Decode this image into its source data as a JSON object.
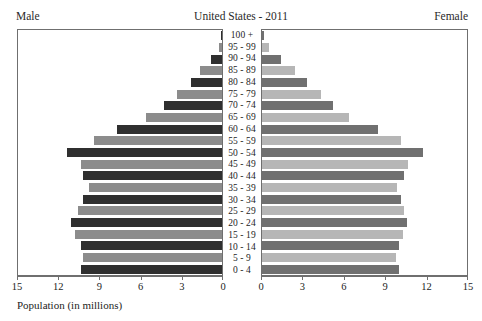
{
  "header": {
    "left_label": "Male",
    "title": "United States - 2011",
    "right_label": "Female"
  },
  "axis": {
    "xlabel": "Population (in millions)",
    "male_ticks": [
      "15",
      "12",
      "9",
      "6",
      "3",
      "0"
    ],
    "female_ticks": [
      "0",
      "3",
      "6",
      "9",
      "12",
      "15"
    ]
  },
  "colors": {
    "male_dark": "#2f2f2f",
    "male_light": "#8c8c8c",
    "female_dark": "#707070",
    "female_light": "#b6b6b6",
    "frame": "#6f6f6f",
    "background": "#ffffff"
  },
  "chart_data": {
    "type": "bar",
    "title": "United States - 2011",
    "subtitle": "",
    "xlabel": "Population (in millions)",
    "ylabel": "",
    "xlim": [
      0,
      15
    ],
    "grid": false,
    "legend_position": "top-outside",
    "orientation": "horizontal-population-pyramid",
    "categories": [
      "100 +",
      "95 - 99",
      "90 - 94",
      "85 - 89",
      "80 - 84",
      "75 - 79",
      "70 - 74",
      "65 - 69",
      "60 - 64",
      "55 - 59",
      "50 - 54",
      "45 - 49",
      "40 - 44",
      "35 - 39",
      "30 - 34",
      "25 - 29",
      "20 - 24",
      "15 - 19",
      "10 - 14",
      "5 - 9",
      "0 - 4"
    ],
    "series": [
      {
        "name": "Male",
        "values": [
          0.05,
          0.25,
          0.8,
          1.6,
          2.3,
          3.3,
          4.3,
          5.6,
          7.7,
          9.4,
          11.4,
          10.4,
          10.2,
          9.8,
          10.2,
          10.6,
          11.1,
          10.8,
          10.4,
          10.2,
          10.4
        ]
      },
      {
        "name": "Female",
        "values": [
          0.12,
          0.5,
          1.4,
          2.4,
          3.3,
          4.3,
          5.2,
          6.4,
          8.5,
          10.2,
          11.8,
          10.7,
          10.4,
          9.9,
          10.2,
          10.4,
          10.6,
          10.3,
          10.0,
          9.8,
          10.0
        ]
      }
    ]
  }
}
